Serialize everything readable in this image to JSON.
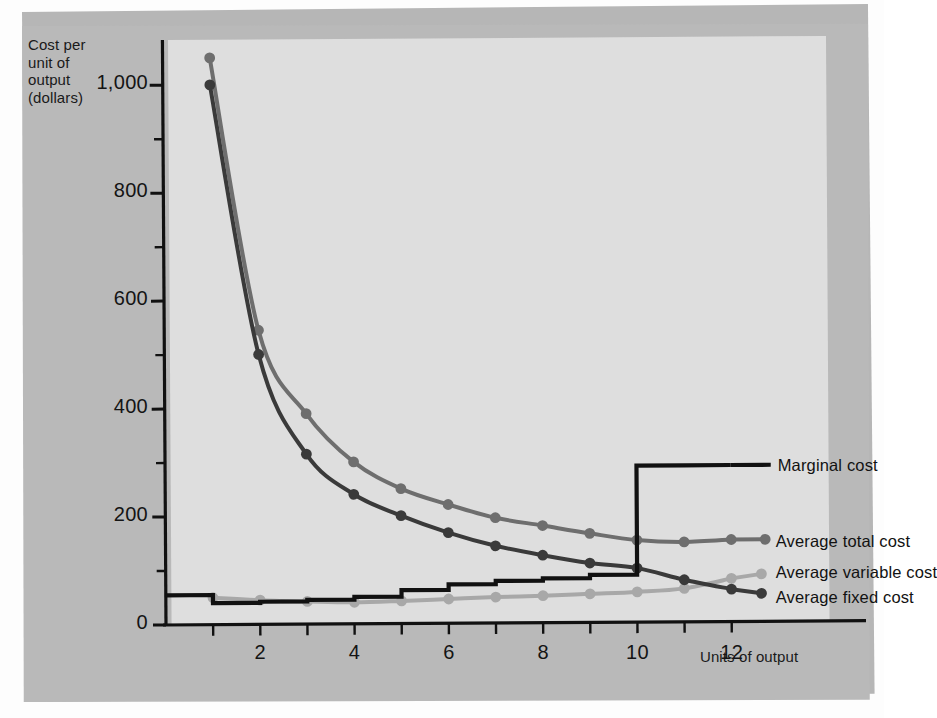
{
  "chart_data": {
    "type": "line",
    "title": "",
    "xlabel": "Units of output",
    "ylabel": "Cost per unit of output (dollars)",
    "ylabel_lines": [
      "Cost per",
      "unit of",
      "output",
      "(dollars)"
    ],
    "xlim": [
      0,
      14
    ],
    "ylim": [
      0,
      1080
    ],
    "yticks": [
      0,
      200,
      400,
      600,
      800,
      1000
    ],
    "ytick_labels": [
      "0",
      "200",
      "400",
      "600",
      "800",
      "1,000"
    ],
    "yminor_step": 100,
    "xticks": [
      1,
      2,
      3,
      4,
      5,
      6,
      7,
      8,
      9,
      10,
      11,
      12
    ],
    "xtick_labels": [
      "2",
      "4",
      "6",
      "8",
      "10",
      "12"
    ],
    "xtick_label_values": [
      2,
      4,
      6,
      8,
      10,
      12
    ],
    "grid": false,
    "legend_position": "right-inline",
    "x": [
      1,
      2,
      3,
      4,
      5,
      6,
      7,
      8,
      9,
      10,
      11,
      12
    ],
    "series": [
      {
        "name": "Average total cost",
        "color": "#6e6e6e",
        "markers": true,
        "values": [
          1050,
          545,
          390,
          300,
          250,
          220,
          195,
          180,
          165,
          152,
          148,
          152
        ]
      },
      {
        "name": "Average fixed cost",
        "color": "#3a3a3a",
        "markers": true,
        "values": [
          1000,
          500,
          315,
          240,
          200,
          168,
          143,
          125,
          110,
          100,
          78,
          60
        ]
      },
      {
        "name": "Average variable cost",
        "color": "#a8a8a8",
        "markers": true,
        "values": [
          50,
          45,
          42,
          40,
          42,
          45,
          48,
          50,
          53,
          56,
          62,
          80
        ]
      },
      {
        "name": "Marginal cost",
        "color": "#111111",
        "markers": false,
        "step": true,
        "values": [
          55,
          40,
          42,
          45,
          50,
          62,
          72,
          78,
          82,
          88,
          290,
          290
        ]
      }
    ],
    "annotations": [
      {
        "label": "Marginal cost",
        "x": 11.6,
        "y": 290
      },
      {
        "label": "Average total cost",
        "x": 12.4,
        "y": 152
      },
      {
        "label": "Average variable cost",
        "x": 12.4,
        "y": 88
      },
      {
        "label": "Average fixed cost",
        "x": 12.4,
        "y": 52
      }
    ]
  },
  "colors": {
    "page_background": "#b6b6b6",
    "plot_background": "#dedede",
    "axis": "#111111",
    "marginal_cost": "#111111",
    "average_total_cost": "#6e6e6e",
    "average_fixed_cost": "#3a3a3a",
    "average_variable_cost": "#a8a8a8"
  }
}
